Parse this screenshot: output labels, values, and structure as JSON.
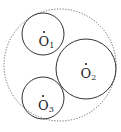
{
  "diagram": {
    "type": "geometry-circles",
    "outer_circle": {
      "cx": 60,
      "cy": 65,
      "r": 56,
      "style": "dotted",
      "color": "#555555"
    },
    "circles": [
      {
        "id": "O1",
        "label_main": "O",
        "label_sub": "1",
        "cx": 43,
        "cy": 34,
        "r": 21,
        "dot": [
          44,
          32
        ]
      },
      {
        "id": "O2",
        "label_main": "O",
        "label_sub": "2",
        "cx": 86,
        "cy": 69,
        "r": 30,
        "dot": [
          86,
          64
        ]
      },
      {
        "id": "O3",
        "label_main": "O",
        "label_sub": "3",
        "cx": 43,
        "cy": 98,
        "r": 21,
        "dot": [
          43,
          96
        ]
      }
    ],
    "stroke_color": "#333333"
  }
}
